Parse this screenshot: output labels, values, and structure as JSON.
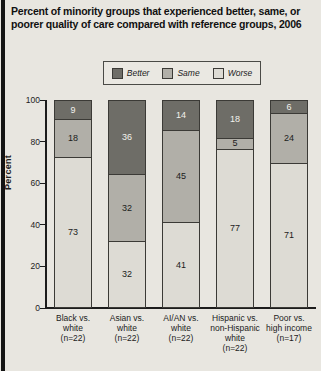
{
  "title": "Percent of minority groups that experienced better, same, or poorer quality of care compared with reference groups, 2006",
  "legend": {
    "items": [
      {
        "label": "Better",
        "color": "#6e6d67"
      },
      {
        "label": "Same",
        "color": "#b1afa8"
      },
      {
        "label": "Worse",
        "color": "#dddbd4"
      }
    ]
  },
  "colors": {
    "better": "#6e6d67",
    "same": "#b1afa8",
    "worse": "#dddbd4",
    "axis": "#1c1c1c",
    "background": "#e8e6e0",
    "page_left_border": "#141414"
  },
  "chart_data": {
    "type": "bar",
    "stacked": true,
    "title": "Percent of minority groups that experienced better, same, or poorer quality of care compared with reference groups, 2006",
    "xlabel": "",
    "ylabel": "Percent",
    "ylim": [
      0,
      100
    ],
    "yticks": [
      0,
      20,
      40,
      60,
      80,
      100
    ],
    "grid": false,
    "legend_position": "top",
    "categories": [
      "Black vs.\nwhite\n(n=22)",
      "Asian vs.\nwhite\n(n=22)",
      "AI/AN vs.\nwhite\n(n=22)",
      "Hispanic vs.\nnon-Hispanic\nwhite\n(n=22)",
      "Poor vs.\nhigh income\n(n=17)"
    ],
    "series": [
      {
        "name": "Better",
        "color": "#6e6d67",
        "label_color": "#f2f1ec",
        "values": [
          9,
          36,
          14,
          18,
          6
        ]
      },
      {
        "name": "Same",
        "color": "#b1afa8",
        "label_color": "#1c1c1c",
        "values": [
          18,
          32,
          45,
          5,
          24
        ]
      },
      {
        "name": "Worse",
        "color": "#dddbd4",
        "label_color": "#1c1c1c",
        "values": [
          73,
          32,
          41,
          77,
          71
        ]
      }
    ]
  }
}
